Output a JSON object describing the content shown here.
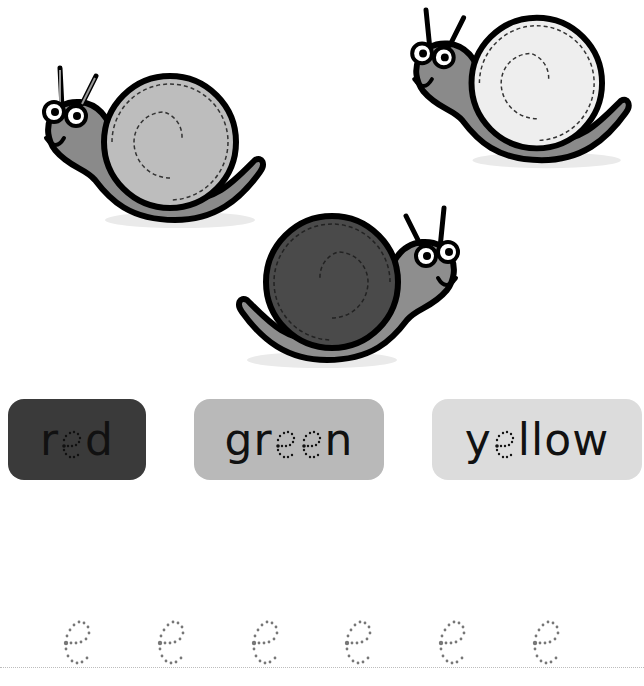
{
  "worksheet": {
    "snails": [
      {
        "id": "snail-left",
        "shell_color": "#bdbdbd",
        "body_color": "#8a8a8a",
        "facing": "left"
      },
      {
        "id": "snail-right",
        "shell_color": "#eeeeee",
        "body_color": "#8a8a8a",
        "facing": "left"
      },
      {
        "id": "snail-center",
        "shell_color": "#4a4a4a",
        "body_color": "#8e8e8e",
        "facing": "right"
      }
    ],
    "cards": [
      {
        "prefix": "r",
        "dotted_count": 1,
        "suffix": "d",
        "word": "red",
        "bg": "#3a3a3a"
      },
      {
        "prefix": "gr",
        "dotted_count": 2,
        "suffix": "n",
        "word": "green",
        "bg": "#b9b9b9"
      },
      {
        "prefix": "y",
        "dotted_count": 1,
        "suffix": "llow",
        "word": "yellow",
        "bg": "#dcdcdc"
      }
    ],
    "tracing": {
      "letter": "e",
      "count": 6,
      "dot_color": "#777777"
    }
  }
}
